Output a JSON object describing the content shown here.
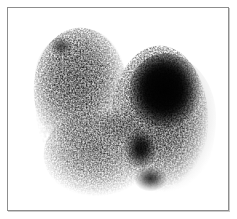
{
  "image": {
    "modality": "scintigraphy",
    "title": "Thyroid scintigram",
    "colormap": "grayscale-inverted",
    "background_color": "#ffffff",
    "activity_color": "#000000",
    "frame_border_color": "#8d8d8d",
    "frame_shadow_color": "#c9c9c9",
    "canvas_width": 237,
    "canvas_height": 219,
    "frame": {
      "left": 7,
      "top": 7,
      "width": 222,
      "height": 204
    },
    "has_annotations": false,
    "has_text_labels": false,
    "has_scale_bar": false,
    "has_color_bar": false,
    "regions": [
      {
        "name": "dominant-hot-nodule",
        "description": "Large intense focal uptake, right of midline, superior",
        "center_x": 164,
        "center_y": 93,
        "width": 72,
        "height": 82,
        "intensity": "maximum",
        "gray_level": "#020202"
      },
      {
        "name": "secondary-focus",
        "description": "Smaller dense focus inferior to dominant nodule",
        "center_x": 140,
        "center_y": 150,
        "width": 36,
        "height": 44,
        "intensity": "high",
        "gray_level": "#1a1a1a"
      },
      {
        "name": "inferior-focus",
        "description": "Faint small focus at inferior aspect",
        "center_x": 151,
        "center_y": 179,
        "width": 34,
        "height": 26,
        "intensity": "moderate",
        "gray_level": "#3d3d3d"
      },
      {
        "name": "left-lobe-diffuse",
        "description": "Diffuse low-level speckled uptake, left of midline",
        "center_x": 80,
        "center_y": 90,
        "width": 92,
        "height": 124,
        "intensity": "low",
        "gray_level": "#bdbdbd"
      },
      {
        "name": "left-lobe-inferior",
        "description": "Inferolateral extension of diffuse left activity",
        "center_x": 96,
        "center_y": 155,
        "width": 104,
        "height": 86,
        "intensity": "low",
        "gray_level": "#cccccc"
      },
      {
        "name": "upper-left-focus",
        "description": "Small darker focus in superior left lobe",
        "center_x": 60,
        "center_y": 46,
        "width": 24,
        "height": 20,
        "intensity": "moderate-low",
        "gray_level": "#6a6a6a"
      },
      {
        "name": "isthmus",
        "description": "Faint band bridging the two lobes",
        "center_x": 120,
        "center_y": 125,
        "width": 48,
        "height": 34,
        "intensity": "very-low",
        "gray_level": "#cfcfcf"
      }
    ],
    "noise": {
      "type": "poisson-speckle",
      "grain_size_px": 3,
      "seed": 20240517
    }
  }
}
